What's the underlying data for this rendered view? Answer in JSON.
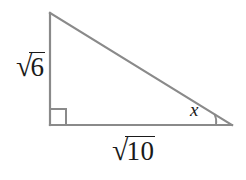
{
  "figure": {
    "type": "right-triangle-diagram",
    "background_color": "#ffffff",
    "stroke_color": "#8a8a8a",
    "text_color": "#1a1a1a",
    "labels": {
      "vertical_leg": {
        "surd": "√",
        "radicand": "6",
        "full": "√6"
      },
      "horizontal_leg": {
        "surd": "√",
        "radicand": "10",
        "full": "√10"
      },
      "angle": "x"
    },
    "marks": {
      "right_angle": "right-angle-square",
      "angle_arc": "angle-arc"
    },
    "geometry": {
      "apex": [
        50,
        13
      ],
      "right_angle_vertex": [
        50,
        125
      ],
      "angle_x_vertex": [
        232,
        125
      ]
    }
  }
}
